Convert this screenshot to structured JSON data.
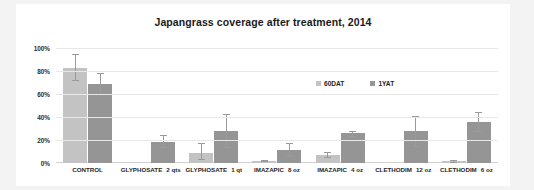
{
  "chart_data": {
    "type": "bar",
    "title": "Japangrass coverage after treatment, 2014",
    "xlabel": "",
    "ylabel": "",
    "ylim": [
      0,
      100
    ],
    "yticks": [
      "0%",
      "20%",
      "40%",
      "60%",
      "80%",
      "100%"
    ],
    "grid": true,
    "legend_position": "inside-upper-right",
    "categories": [
      {
        "name": "CONTROL",
        "rate": ""
      },
      {
        "name": "GLYPHOSATE",
        "rate": "2 qts"
      },
      {
        "name": "GLYPHOSATE",
        "rate": "1 qt"
      },
      {
        "name": "IMAZAPIC",
        "rate": "8 oz"
      },
      {
        "name": "IMAZAPIC",
        "rate": "4 oz"
      },
      {
        "name": "CLETHODIM",
        "rate": "12 oz"
      },
      {
        "name": "CLETHODIM",
        "rate": "6 oz"
      }
    ],
    "series": [
      {
        "name": "60DAT",
        "color": "#c3c3c3",
        "values": [
          83,
          0,
          9,
          2,
          7,
          0,
          1.5
        ],
        "err_low": [
          71,
          0,
          3,
          1,
          4,
          0,
          0
        ],
        "err_high": [
          95,
          0,
          17,
          3,
          10,
          0,
          3
        ]
      },
      {
        "name": "1YAT",
        "color": "#959595",
        "values": [
          69,
          18,
          28,
          11,
          26,
          28,
          36
        ],
        "err_low": [
          59,
          13,
          13,
          5,
          23,
          14,
          27
        ],
        "err_high": [
          78,
          24,
          43,
          17,
          28,
          41,
          44
        ]
      }
    ]
  },
  "legend": {
    "items": [
      {
        "label": "60DAT",
        "color": "#c3c3c3"
      },
      {
        "label": "1YAT",
        "color": "#959595"
      }
    ]
  }
}
